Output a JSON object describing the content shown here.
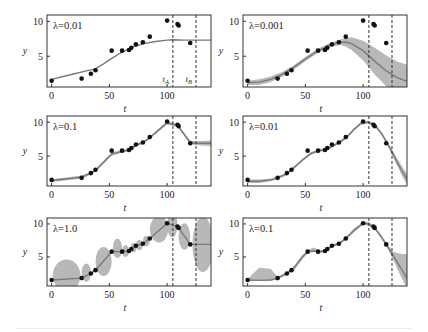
{
  "figure": {
    "layout": {
      "rows": 3,
      "cols": 2
    },
    "colors": {
      "band": "#b8b8b8",
      "mean_line": "#7a7a7a",
      "points": "#111111",
      "frame": "#333333",
      "dashed": "#333333"
    }
  },
  "chart_data": {
    "type": "line",
    "shared": {
      "xlabel": "t",
      "ylabel": "y",
      "xticks": [
        0,
        50,
        100
      ],
      "yticks": [
        5,
        10
      ],
      "xlim": [
        -4,
        138
      ],
      "ylim": [
        0.6,
        10.9
      ],
      "vertical_markers": [
        {
          "t": 105,
          "label": "t_A",
          "display": "tA"
        },
        {
          "t": 125,
          "label": "t_B",
          "display": "tB"
        }
      ],
      "data_points": {
        "t": [
          0,
          26,
          34,
          38,
          52,
          61,
          67,
          69,
          73,
          79,
          85,
          100,
          109,
          110,
          120
        ],
        "y": [
          1.5,
          1.8,
          2.5,
          3.0,
          5.8,
          5.8,
          5.9,
          6.2,
          6.7,
          7.0,
          7.8,
          10.1,
          9.6,
          9.4,
          6.9
        ]
      }
    },
    "panels": [
      {
        "id": "row1-left",
        "label": "λ=0.01",
        "show_marker_labels": true,
        "mean": {
          "t": [
            0,
            10,
            20,
            30,
            38,
            45,
            52,
            60,
            70,
            80,
            90,
            100,
            105,
            115,
            125,
            138
          ],
          "y": [
            1.7,
            2.1,
            2.5,
            2.9,
            3.2,
            3.9,
            4.7,
            5.5,
            6.3,
            6.8,
            7.1,
            7.3,
            7.35,
            7.3,
            7.3,
            7.3
          ]
        },
        "band_halfwidth": [
          0,
          0,
          0,
          0,
          0,
          0,
          0,
          0,
          0,
          0,
          0,
          0,
          0,
          0,
          0,
          0
        ]
      },
      {
        "id": "row1-right",
        "label": "λ=0.001",
        "show_marker_labels": false,
        "mean": {
          "t": [
            0,
            10,
            20,
            30,
            40,
            50,
            60,
            70,
            80,
            85,
            90,
            100,
            110,
            120,
            130,
            138
          ],
          "y": [
            1.2,
            1.3,
            1.7,
            2.4,
            3.4,
            4.6,
            5.7,
            6.5,
            7.0,
            7.0,
            6.8,
            5.8,
            4.3,
            2.9,
            1.9,
            1.4
          ]
        },
        "band_halfwidth": [
          0.3,
          0.4,
          0.4,
          0.35,
          0.3,
          0.3,
          0.3,
          0.3,
          0.4,
          0.6,
          0.9,
          1.4,
          1.9,
          2.2,
          2.3,
          2.4
        ]
      },
      {
        "id": "row2-left",
        "label": "λ=0.1",
        "show_marker_labels": false,
        "mean": {
          "t": [
            0,
            26,
            34,
            38,
            52,
            61,
            67,
            69,
            73,
            79,
            85,
            100,
            109,
            110,
            120,
            125,
            138
          ],
          "y": [
            1.4,
            1.9,
            2.5,
            2.9,
            5.3,
            5.7,
            5.9,
            6.1,
            6.6,
            7.0,
            7.7,
            9.9,
            9.5,
            9.3,
            7.0,
            6.9,
            6.9
          ]
        },
        "band_halfwidth": [
          0.2,
          0.25,
          0.2,
          0.2,
          0.25,
          0.2,
          0.2,
          0.2,
          0.2,
          0.2,
          0.2,
          0.25,
          0.2,
          0.2,
          0.25,
          0.3,
          0.4
        ]
      },
      {
        "id": "row2-right",
        "label": "λ=0.01",
        "show_marker_labels": false,
        "mean": {
          "t": [
            0,
            10,
            20,
            26,
            34,
            40,
            48,
            55,
            62,
            68,
            74,
            80,
            86,
            92,
            98,
            104,
            110,
            116,
            122,
            128,
            134,
            138
          ],
          "y": [
            1.3,
            1.3,
            1.5,
            1.8,
            2.4,
            3.3,
            4.5,
            5.4,
            5.8,
            6.0,
            6.5,
            7.1,
            7.8,
            8.9,
            9.8,
            10.0,
            9.6,
            8.3,
            6.6,
            4.6,
            2.7,
            1.6
          ]
        },
        "band_halfwidth": [
          0.25,
          0.25,
          0.2,
          0.2,
          0.2,
          0.2,
          0.2,
          0.2,
          0.2,
          0.2,
          0.2,
          0.2,
          0.2,
          0.2,
          0.2,
          0.25,
          0.25,
          0.25,
          0.3,
          0.5,
          0.7,
          0.8
        ]
      },
      {
        "id": "row3-left",
        "label": "λ=1.0",
        "show_marker_labels": false,
        "mean": {
          "t": [
            0,
            26,
            34,
            38,
            52,
            61,
            67,
            69,
            73,
            79,
            85,
            100,
            109,
            110,
            120,
            125,
            138
          ],
          "y": [
            1.5,
            1.8,
            2.5,
            3.0,
            5.8,
            5.8,
            5.9,
            6.2,
            6.7,
            7.0,
            7.8,
            10.1,
            9.6,
            9.4,
            6.9,
            6.9,
            6.9
          ]
        },
        "band_ellipses": [
          {
            "t": 13,
            "y": 2.2,
            "rx": 12,
            "ry": 2.4
          },
          {
            "t": 30,
            "y": 2.6,
            "rx": 4,
            "ry": 1.4
          },
          {
            "t": 45,
            "y": 4.3,
            "rx": 7,
            "ry": 2.2
          },
          {
            "t": 57,
            "y": 6.3,
            "rx": 4,
            "ry": 1.5
          },
          {
            "t": 64,
            "y": 5.9,
            "rx": 3,
            "ry": 0.9
          },
          {
            "t": 71,
            "y": 6.4,
            "rx": 2.5,
            "ry": 0.7
          },
          {
            "t": 76,
            "y": 6.8,
            "rx": 3,
            "ry": 0.8
          },
          {
            "t": 82,
            "y": 7.4,
            "rx": 3,
            "ry": 0.8
          },
          {
            "t": 93,
            "y": 9.2,
            "rx": 8,
            "ry": 2.0
          },
          {
            "t": 104.5,
            "y": 9.8,
            "rx": 4.5,
            "ry": 1.8
          },
          {
            "t": 115,
            "y": 8.1,
            "rx": 5,
            "ry": 2.0
          },
          {
            "t": 131,
            "y": 6.9,
            "rx": 9,
            "ry": 4.2
          }
        ]
      },
      {
        "id": "row3-right",
        "label": "λ=0.1",
        "show_marker_labels": false,
        "mean": {
          "t": [
            0,
            10,
            20,
            26,
            34,
            40,
            47,
            52,
            57,
            62,
            67,
            73,
            79,
            85,
            92,
            100,
            105,
            110,
            116,
            120,
            126,
            132,
            138
          ],
          "y": [
            1.5,
            1.45,
            1.5,
            1.8,
            2.5,
            3.3,
            4.9,
            5.8,
            5.9,
            5.8,
            5.9,
            6.7,
            7.0,
            7.8,
            9.0,
            10.1,
            10.0,
            9.4,
            8.0,
            6.9,
            5.2,
            3.5,
            1.8
          ]
        },
        "band_halfwidth": [
          0.15,
          1.0,
          0.9,
          0.2,
          0.2,
          0.3,
          0.35,
          0.2,
          0.35,
          0.2,
          0.2,
          0.2,
          0.2,
          0.2,
          0.3,
          0.2,
          0.3,
          0.2,
          0.3,
          0.2,
          0.6,
          1.6,
          2.6
        ],
        "band_center_offset": [
          0,
          0.9,
          0.8,
          0,
          0,
          0,
          0,
          0,
          0.2,
          0,
          0,
          0,
          0,
          0,
          0,
          0,
          0,
          0,
          0,
          0,
          0,
          0.4,
          1.0
        ]
      }
    ]
  },
  "labels": {
    "xlabel": "t",
    "ylabel": "y",
    "marker_a": "tA",
    "marker_b": "tB"
  }
}
